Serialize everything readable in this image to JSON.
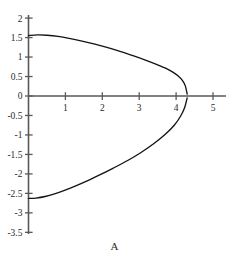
{
  "figure": {
    "caption": "A",
    "background_color": "#ffffff",
    "axis_color": "#595959",
    "curve_color": "#141414"
  },
  "chart_data": {
    "type": "line",
    "title": "",
    "subtitle": "",
    "xlabel": "",
    "ylabel": "",
    "annotations": [
      "A"
    ],
    "legend": [],
    "legend_position": "none",
    "grid": false,
    "xlim": [
      -0.15,
      5.35
    ],
    "ylim": [
      -3.5,
      2.0
    ],
    "xticks": [
      1,
      2,
      3,
      4,
      5
    ],
    "xtick_labels": [
      "1",
      "2",
      "3",
      "4",
      "5"
    ],
    "yticks": [
      2,
      1.5,
      1,
      0.5,
      0,
      -0.5,
      -1,
      -1.5,
      -2,
      -2.5,
      -3,
      -3.5
    ],
    "ytick_labels": [
      "2",
      "1.5",
      "1",
      "0.5",
      "0",
      "-0.5",
      "-1",
      "-1.5",
      "-2",
      "-2.5",
      "-3",
      "-3.5"
    ],
    "series": [
      {
        "name": "upper-branch",
        "x": [
          0.0,
          0.25,
          0.5,
          0.8,
          1.1,
          1.45,
          1.8,
          2.15,
          2.5,
          2.85,
          3.15,
          3.45,
          3.7,
          3.9,
          4.05,
          4.17,
          4.25,
          4.3
        ],
        "y": [
          1.55,
          1.57,
          1.56,
          1.53,
          1.48,
          1.41,
          1.33,
          1.24,
          1.14,
          1.03,
          0.93,
          0.82,
          0.72,
          0.62,
          0.52,
          0.4,
          0.26,
          0.05
        ]
      },
      {
        "name": "lower-branch",
        "x": [
          0.0,
          0.2,
          0.45,
          0.75,
          1.1,
          1.5,
          1.9,
          2.3,
          2.7,
          3.05,
          3.4,
          3.7,
          3.95,
          4.12,
          4.23,
          4.3
        ],
        "y": [
          -2.63,
          -2.62,
          -2.58,
          -2.5,
          -2.38,
          -2.22,
          -2.04,
          -1.85,
          -1.65,
          -1.45,
          -1.22,
          -0.99,
          -0.75,
          -0.52,
          -0.3,
          -0.05
        ]
      }
    ],
    "vertex": {
      "x": 4.3,
      "y": -0.05
    },
    "x_intercepts": [
      4.3
    ],
    "y_intercepts": [
      1.55,
      -2.63
    ]
  }
}
